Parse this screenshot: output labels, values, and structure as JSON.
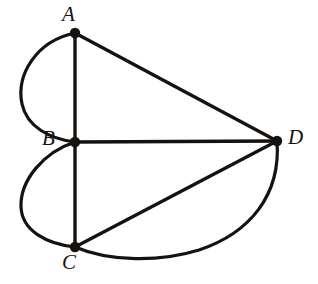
{
  "figure": {
    "kind": "graph-diagram",
    "background_color": "#ffffff",
    "ink_color": "#16120f"
  },
  "vertices": [
    {
      "id": "A",
      "label": "A",
      "x": 75,
      "y": 33,
      "label_x": 62,
      "label_y": 4,
      "dot_radius": 5.2
    },
    {
      "id": "B",
      "label": "B",
      "x": 75,
      "y": 142,
      "label_x": 42,
      "label_y": 128,
      "dot_radius": 5.2
    },
    {
      "id": "C",
      "label": "C",
      "x": 75,
      "y": 247,
      "label_x": 62,
      "label_y": 252,
      "dot_radius": 5.2
    },
    {
      "id": "D",
      "label": "D",
      "x": 277,
      "y": 141,
      "label_x": 288,
      "label_y": 127,
      "dot_radius": 5.2
    }
  ],
  "edges": [
    {
      "id": "AB-straight",
      "from": "A",
      "to": "B",
      "shape": "straight",
      "path": "M 75 33 L 75 142"
    },
    {
      "id": "BC-straight",
      "from": "B",
      "to": "C",
      "shape": "straight",
      "path": "M 75 142 L 75 247"
    },
    {
      "id": "AD-straight",
      "from": "A",
      "to": "D",
      "shape": "straight",
      "path": "M 75 33 L 277 141"
    },
    {
      "id": "BD-straight",
      "from": "B",
      "to": "D",
      "shape": "straight",
      "path": "M 75 142 L 277 141"
    },
    {
      "id": "CD-straight",
      "from": "C",
      "to": "D",
      "shape": "straight",
      "path": "M 75 247 L 277 141"
    },
    {
      "id": "AB-arc",
      "from": "A",
      "to": "B",
      "shape": "curved",
      "bulge": "left",
      "path": "M 75 33 C 36 41 16 75 22 104 C 27 127 50 139 75 142"
    },
    {
      "id": "BC-arc",
      "from": "B",
      "to": "C",
      "shape": "curved",
      "bulge": "left",
      "path": "M 75 142 C 44 152 20 180 21 207 C 22 231 47 244 75 247"
    },
    {
      "id": "CD-arc",
      "from": "C",
      "to": "D",
      "shape": "curved",
      "bulge": "down-right",
      "path": "M 75 247 C 110 262 160 262 199 250 C 250 233 281 195 277 141"
    }
  ],
  "counts": {
    "vertex_count": 4,
    "edge_count": 8,
    "straight_edge_count": 5,
    "curved_edge_count": 3
  }
}
